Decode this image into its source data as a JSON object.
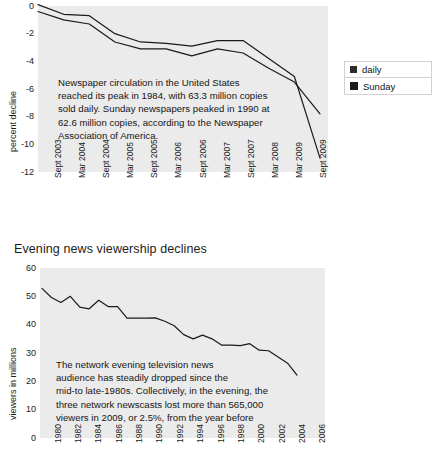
{
  "page": {
    "width": 435,
    "height": 473,
    "background": "#ffffff",
    "plot_background": "#ebebeb",
    "line_color": "#1a1a1a"
  },
  "figures": [
    {
      "id": "newspaper-circulation",
      "title": "",
      "legend": {
        "items": [
          {
            "label": "daily",
            "swatch_color": "#2d2d2d",
            "style": "small"
          },
          {
            "label": "Sunday",
            "swatch_color": "#1a1a1a",
            "style": "large"
          }
        ]
      },
      "annotation": [
        "Newspaper circulation in the United States",
        "reached its peak in 1984, with 63.3 million copies",
        "sold daily. Sunday newspapers peaked in 1990 at",
        "62.6 million copies, according to the Newspaper",
        "Association of America."
      ],
      "chart_data": {
        "type": "line",
        "title": "",
        "xlabel": "",
        "ylabel": "percent decline",
        "ylim": [
          -12,
          0
        ],
        "yticks": [
          0,
          -2,
          -4,
          -6,
          -8,
          -10,
          -12
        ],
        "ytick_labels": [
          "0",
          "-2",
          "-4",
          "-6",
          "-8",
          "-10",
          "-12"
        ],
        "grid": false,
        "legend_position": "right",
        "categories": [
          "Sept 2003",
          "Mar 2004",
          "Sept 2004",
          "Mar 2005",
          "Sept 2005",
          "Mar 2006",
          "Sept 2006",
          "Mar 2007",
          "Sept 2007",
          "Mar 2008",
          "Mar 2009",
          "Sept 2009"
        ],
        "xtick_labels": [
          "Sept 2003",
          "Mar 2004",
          "Sept 2004",
          "Mar 2005",
          "Sept 2005",
          "Mar 2006",
          "Sept 2006",
          "Mar 2007",
          "Sept 2007",
          "Mar 2008",
          "Mar 2009",
          "Sept 2009"
        ],
        "series": [
          {
            "name": "daily",
            "values": [
              -0.4,
              -1.0,
              -1.3,
              -2.6,
              -3.1,
              -3.1,
              -3.6,
              -3.1,
              -3.4,
              -4.5,
              -5.5,
              -7.8
            ]
          },
          {
            "name": "Sunday",
            "values": [
              0.1,
              -0.6,
              -0.7,
              -2.0,
              -2.6,
              -2.7,
              -2.9,
              -2.5,
              -2.5,
              -3.8,
              -5.1,
              -11.0
            ]
          }
        ]
      }
    },
    {
      "id": "evening-news-viewership",
      "title": "Evening news viewership declines",
      "legend": {
        "items": []
      },
      "annotation": [
        "The network evening television news",
        "audience has steadily dropped since the",
        "mid-to late-1980s. Collectively, in the evening, the",
        "three network newscasts lost more than 565,000",
        "viewers in 2009, or 2.5%, from the year before"
      ],
      "chart_data": {
        "type": "line",
        "title": "Evening news viewership declines",
        "xlabel": "",
        "ylabel": "viewers in millions",
        "ylim": [
          0,
          60
        ],
        "yticks": [
          60,
          50,
          40,
          30,
          20,
          10,
          0
        ],
        "ytick_labels": [
          "60",
          "50",
          "40",
          "30",
          "20",
          "10",
          "0"
        ],
        "grid": false,
        "legend_position": "none",
        "xtick_labels": [
          "1980",
          "1982",
          "1984",
          "1986",
          "1988",
          "1990",
          "1992",
          "1994",
          "1996",
          "1998",
          "2000",
          "2002",
          "2004",
          "2006"
        ],
        "x": [
          1980,
          1981,
          1982,
          1983,
          1984,
          1985,
          1986,
          1987,
          1988,
          1989,
          1990,
          1991,
          1992,
          1993,
          1994,
          1995,
          1996,
          1997,
          1998,
          1999,
          2000,
          2001,
          2002,
          2003,
          2004,
          2005,
          2006,
          2007
        ],
        "series": [
          {
            "name": "viewers in millions",
            "values": [
              52.8,
              49.6,
              47.8,
              50.0,
              46.2,
              45.6,
              48.6,
              46.4,
              46.4,
              42.3,
              42.3,
              42.3,
              42.4,
              41.2,
              39.6,
              36.5,
              35.0,
              36.3,
              35.0,
              32.8,
              32.8,
              32.6,
              33.3,
              31.0,
              30.8,
              28.6,
              26.4,
              22.2
            ]
          }
        ]
      }
    }
  ]
}
